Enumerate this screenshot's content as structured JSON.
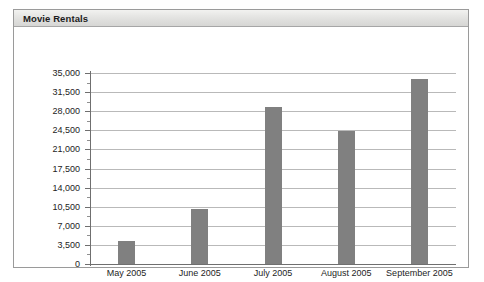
{
  "panel": {
    "title": "Movie Rentals"
  },
  "chart_data": {
    "type": "bar",
    "title": "Movie Rentals",
    "xlabel": "",
    "ylabel": "",
    "categories": [
      "May 2005",
      "June 2005",
      "July 2005",
      "August 2005",
      "September 2005"
    ],
    "values": [
      4200,
      10100,
      28700,
      24300,
      33900
    ],
    "ylim": [
      0,
      35000
    ],
    "ytick_step": 3500,
    "ytick_labels": [
      "35,000",
      "31,500",
      "28,000",
      "24,500",
      "21,000",
      "17,500",
      "14,000",
      "10,500",
      "7,000",
      "3,500",
      "0"
    ],
    "ytick_values": [
      35000,
      31500,
      28000,
      24500,
      21000,
      17500,
      14000,
      10500,
      7000,
      3500,
      0
    ],
    "grid": true,
    "legend": false,
    "bar_color": "#808080",
    "gridline_color": "#b9b9b9",
    "axis_color": "#6f6f6f",
    "minor_ticks": true
  }
}
